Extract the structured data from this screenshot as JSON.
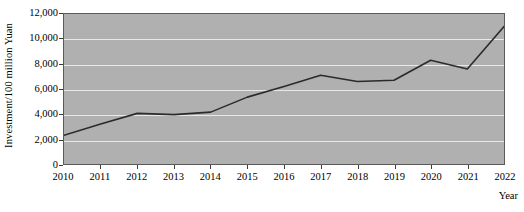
{
  "chart_data": {
    "type": "line",
    "title": "",
    "xlabel": "Year",
    "ylabel": "Investment/100 million Yuan",
    "categories": [
      "2010",
      "2011",
      "2012",
      "2013",
      "2014",
      "2015",
      "2016",
      "2017",
      "2018",
      "2019",
      "2020",
      "2021",
      "2022"
    ],
    "x": [
      2010,
      2011,
      2012,
      2013,
      2014,
      2015,
      2016,
      2017,
      2018,
      2019,
      2020,
      2021,
      2022
    ],
    "values": [
      2300,
      3200,
      4050,
      3950,
      4150,
      5350,
      6200,
      7100,
      6600,
      6700,
      8300,
      7600,
      11000
    ],
    "series": [
      {
        "name": "Investment",
        "values": [
          2300,
          3200,
          4050,
          3950,
          4150,
          5350,
          6200,
          7100,
          6600,
          6700,
          8300,
          7600,
          11000
        ]
      }
    ],
    "ylim": [
      0,
      12000
    ],
    "xlim": [
      2010,
      2022
    ],
    "yticks": [
      0,
      2000,
      4000,
      6000,
      8000,
      10000,
      12000
    ],
    "ytick_labels": [
      "0",
      "2,000",
      "4,000",
      "6,000",
      "8,000",
      "10,000",
      "12,000"
    ],
    "xticks": [
      2010,
      2011,
      2012,
      2013,
      2014,
      2015,
      2016,
      2017,
      2018,
      2019,
      2020,
      2021,
      2022
    ],
    "xtick_labels": [
      "2010",
      "2011",
      "2012",
      "2013",
      "2014",
      "2015",
      "2016",
      "2017",
      "2018",
      "2019",
      "2020",
      "2021",
      "2022"
    ],
    "grid": true,
    "grid_axis": "y",
    "legend": false,
    "legend_position": "none",
    "colors": {
      "plot_background": "#b0b0b0",
      "figure_background": "#ffffff",
      "gridline": "#e8e8e8",
      "line": "#2b2b2b",
      "axis": "#5a5a5a",
      "text": "#000000"
    },
    "line_width": 1.6,
    "markers": false,
    "annotations": []
  }
}
